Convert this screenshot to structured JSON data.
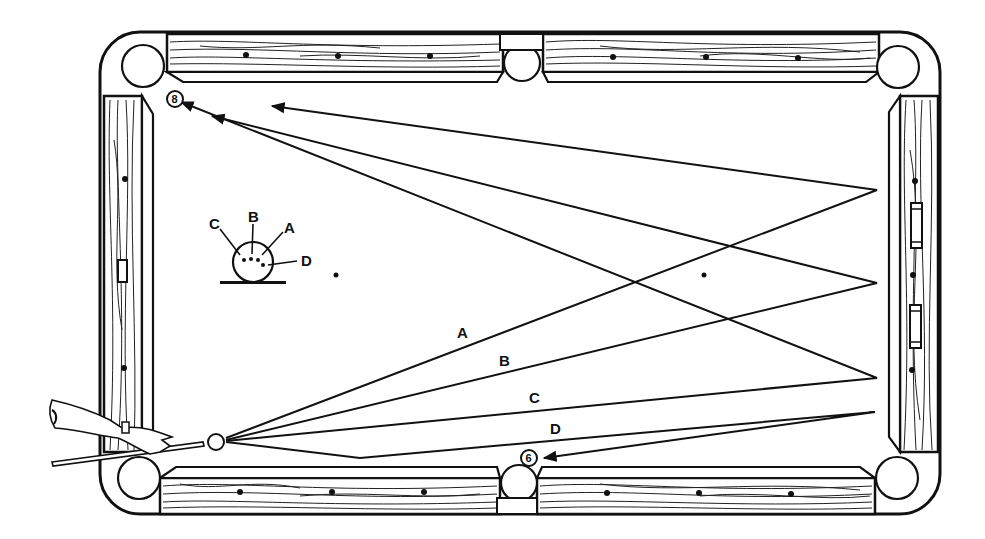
{
  "figure": {
    "title": "",
    "colors": {
      "ink": "#111111",
      "background": "#ffffff"
    }
  },
  "inset": {
    "labels": {
      "a": "A",
      "b": "B",
      "c": "C",
      "d": "D"
    },
    "caption": "Cue ball contact points"
  },
  "paths": {
    "a": {
      "label": "A"
    },
    "b": {
      "label": "B"
    },
    "c": {
      "label": "C"
    },
    "d": {
      "label": "D"
    }
  },
  "balls": {
    "object_ball_top": {
      "number": "8"
    },
    "object_ball_bottom": {
      "number": "6"
    },
    "cue_ball": {
      "number": ""
    }
  },
  "table": {
    "pockets": [
      "top-left",
      "top-center",
      "top-right",
      "bottom-left",
      "bottom-center",
      "bottom-right"
    ],
    "diamonds_per_long_rail_section": 3,
    "diamonds_per_short_rail": 3
  }
}
